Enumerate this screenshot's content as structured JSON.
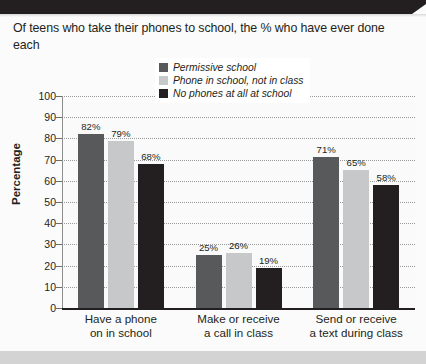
{
  "headline": "Of teens who take their phones to school, the % who have ever done each",
  "chart_data": {
    "type": "bar",
    "title": "",
    "xlabel": "",
    "ylabel": "Percentage",
    "ylim": [
      0,
      100
    ],
    "ytick_step": 10,
    "yticks": [
      "100",
      "90",
      "80",
      "70",
      "60",
      "50",
      "40",
      "30",
      "20",
      "10",
      "0"
    ],
    "grid": true,
    "legend_position": "top-center",
    "value_suffix": "%",
    "categories": [
      "Have a phone\non in school",
      "Make or receive\na call in class",
      "Send or receive\na text during class"
    ],
    "category_lines": [
      [
        "Have a phone",
        "on in school"
      ],
      [
        "Make or receive",
        "a call in class"
      ],
      [
        "Send or receive",
        "a text during class"
      ]
    ],
    "series": [
      {
        "name": "Permissive school",
        "color": "#58595b",
        "values": [
          82,
          25,
          71
        ],
        "labels": [
          "82%",
          "25%",
          "71%"
        ]
      },
      {
        "name": "Phone in school, not in class",
        "color": "#c7c8ca",
        "values": [
          79,
          26,
          65
        ],
        "labels": [
          "79%",
          "26%",
          "65%"
        ]
      },
      {
        "name": "No phones at all at school",
        "color": "#231f20",
        "values": [
          68,
          19,
          58
        ],
        "labels": [
          "68%",
          "19%",
          "58%"
        ]
      }
    ]
  },
  "colors": {
    "banner": "#231f20",
    "plot_background": "#fafafa",
    "gridline": "#9a9a9a",
    "axis": "#231f20",
    "text": "#231f20",
    "footer_bar": "#d3d3d3"
  }
}
